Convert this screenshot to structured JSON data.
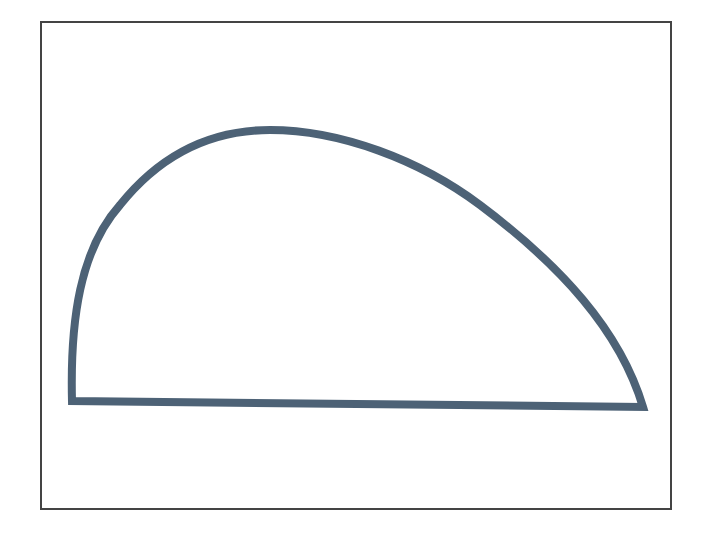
{
  "figure": {
    "frame": {
      "x": 41,
      "y": 22,
      "width": 630,
      "height": 487,
      "stroke": "#444444",
      "stroke_width": 2
    },
    "shape": {
      "name": "half-dome",
      "stroke": "#4d6276",
      "stroke_width": 8,
      "fill": "none",
      "baseline_left": [
        72,
        401
      ],
      "baseline_right": [
        643,
        407
      ],
      "peak": [
        270,
        130
      ]
    }
  }
}
